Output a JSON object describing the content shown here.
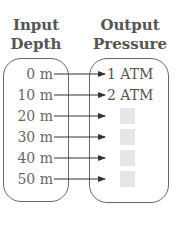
{
  "headers": {
    "input": [
      "Input",
      "Depth"
    ],
    "output": [
      "Output",
      "Pressure"
    ]
  },
  "rows": [
    {
      "input": "0 m",
      "output": "1 ATM"
    },
    {
      "input": "10 m",
      "output": "2 ATM"
    },
    {
      "input": "20 m",
      "output": ""
    },
    {
      "input": "30 m",
      "output": ""
    },
    {
      "input": "40 m",
      "output": ""
    },
    {
      "input": "50 m",
      "output": ""
    }
  ],
  "colors": {
    "line": "#333333",
    "text": "#5a5a5a",
    "blank": "#e6e6e6"
  }
}
